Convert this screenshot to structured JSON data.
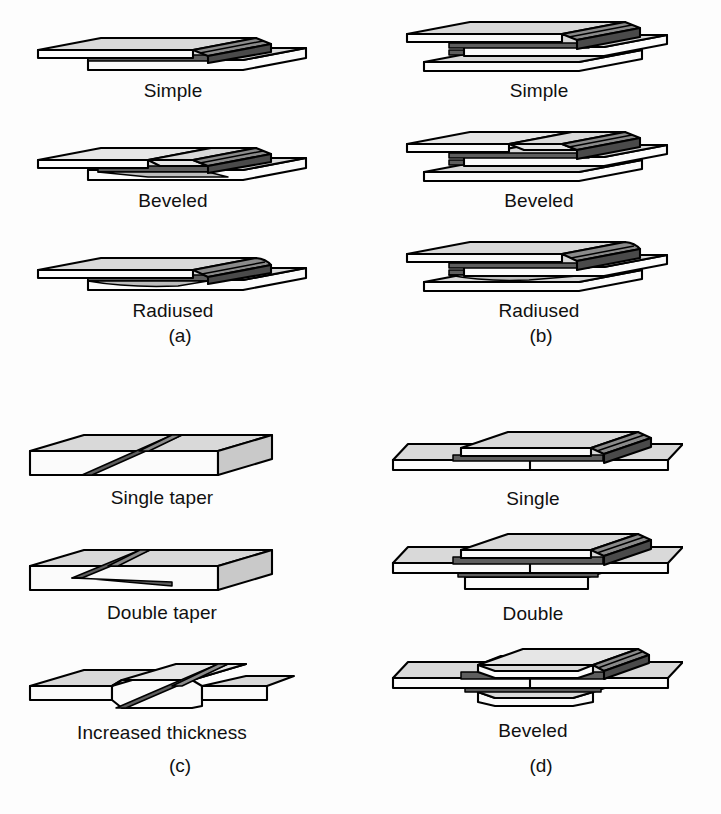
{
  "figure": {
    "background_color": "#fdfdfd",
    "line_color": "#000000",
    "plate_fill": "#d9d9d9",
    "adhesive_fill": "#5e5e5e"
  },
  "panels": [
    {
      "key": "a",
      "letter": "(a)",
      "description": "Single lap joints",
      "joints": [
        {
          "id": "a1",
          "label": "Simple",
          "type": "single-lap-simple"
        },
        {
          "id": "a2",
          "label": "Beveled",
          "type": "single-lap-beveled"
        },
        {
          "id": "a3",
          "label": "Radiused",
          "type": "single-lap-radiused"
        }
      ]
    },
    {
      "key": "b",
      "letter": "(b)",
      "description": "Double lap joints",
      "joints": [
        {
          "id": "b1",
          "label": "Simple",
          "type": "double-lap-simple"
        },
        {
          "id": "b2",
          "label": "Beveled",
          "type": "double-lap-beveled"
        },
        {
          "id": "b3",
          "label": "Radiused",
          "type": "double-lap-radiused"
        }
      ]
    },
    {
      "key": "c",
      "letter": "(c)",
      "description": "Scarf and tapered joints",
      "joints": [
        {
          "id": "c1",
          "label": "Single taper",
          "type": "scarf-single-taper"
        },
        {
          "id": "c2",
          "label": "Double taper",
          "type": "scarf-double-taper"
        },
        {
          "id": "c3",
          "label": "Increased thickness",
          "type": "scarf-increased-thickness"
        }
      ]
    },
    {
      "key": "d",
      "letter": "(d)",
      "description": "Strap joints",
      "joints": [
        {
          "id": "d1",
          "label": "Single",
          "type": "strap-single"
        },
        {
          "id": "d2",
          "label": "Double",
          "type": "strap-double"
        },
        {
          "id": "d3",
          "label": "Beveled",
          "type": "strap-beveled"
        }
      ]
    }
  ]
}
